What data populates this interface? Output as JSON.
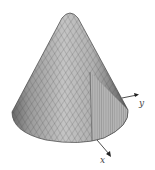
{
  "figure": {
    "type": "3d-surface",
    "surface": "cone",
    "colors": {
      "surface_light": "#d8d8d8",
      "surface_mid": "#a8a8a8",
      "surface_dark": "#5a5a5a",
      "mesh_line": "#3a3a3a",
      "axis": "#222222",
      "background": "#ffffff"
    },
    "axes": {
      "x": {
        "label": "x"
      },
      "y": {
        "label": "y"
      }
    }
  }
}
